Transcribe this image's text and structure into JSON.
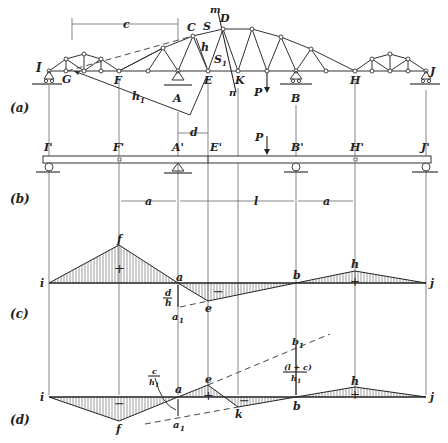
{
  "figure": {
    "panels": [
      {
        "id": "a",
        "label": "(a)",
        "description": "Truss with suspended spans; section m-n cuts members S and S1"
      },
      {
        "id": "b",
        "label": "(b)",
        "description": "Equivalent beam with hinges F' and H'"
      },
      {
        "id": "c",
        "label": "(c)",
        "description": "Influence line for S"
      },
      {
        "id": "d",
        "label": "(d)",
        "description": "Influence line for S1"
      }
    ],
    "truss_labels": {
      "I": "I",
      "G": "G",
      "F": "F",
      "A": "A",
      "C": "C",
      "S": "S",
      "m": "m",
      "D": "D",
      "h": "h",
      "S1": "S",
      "S1_sub": "1",
      "E": "E",
      "K": "K",
      "n": "n",
      "P": "P",
      "B": "B",
      "H": "H",
      "J": "J",
      "h1": "h",
      "h1_sub": "1",
      "c": "c",
      "d": "d"
    },
    "beam_labels": {
      "I": "I'",
      "F": "F'",
      "A": "A'",
      "E": "E'",
      "P": "P",
      "B": "B'",
      "H": "H'",
      "J": "J'",
      "a_left": "a",
      "l": "l",
      "a_right": "a"
    },
    "il_S": {
      "labels": {
        "i": "i",
        "f": "f",
        "a": "a",
        "e": "e",
        "b": "b",
        "h": "h",
        "j": "j",
        "a1": "a",
        "a1_sub": "1",
        "ratio_num": "d",
        "ratio_den": "h"
      },
      "signs": [
        "+",
        "−",
        "+"
      ]
    },
    "il_S1": {
      "labels": {
        "i": "i",
        "f": "f",
        "a": "a",
        "e": "e",
        "k": "k",
        "b": "b",
        "h": "h",
        "j": "j",
        "a1": "a",
        "a1_sub": "1",
        "b1": "b",
        "b1_sub": "1",
        "ratio1_num": "c",
        "ratio1_den": "h",
        "ratio1_den_sub": "1",
        "ratio2_num": "(l + c)",
        "ratio2_den": "h",
        "ratio2_den_sub": "1"
      },
      "signs": [
        "−",
        "+",
        "−",
        "+"
      ]
    }
  },
  "colors": {
    "ink": "#222222",
    "background": "#ffffff"
  }
}
